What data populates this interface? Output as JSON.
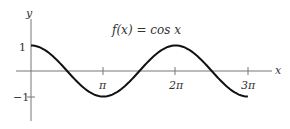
{
  "chart_data": {
    "type": "line",
    "title": "f(x) = cos x",
    "xlabel": "x",
    "ylabel": "y",
    "x_ticks": [
      {
        "value": 3.14159,
        "label": "π"
      },
      {
        "value": 6.28318,
        "label": "2π"
      },
      {
        "value": 9.42478,
        "label": "3π"
      }
    ],
    "y_ticks": [
      {
        "value": 1,
        "label": "1"
      },
      {
        "value": -1,
        "label": "−1"
      }
    ],
    "xlim": [
      0,
      9.42478
    ],
    "ylim": [
      -1,
      1
    ],
    "series": [
      {
        "name": "cos x",
        "function": "cos",
        "x_start": 0,
        "x_end": 9.42478,
        "points": [
          [
            0,
            1
          ],
          [
            1.5708,
            0
          ],
          [
            3.14159,
            -1
          ],
          [
            4.71239,
            0
          ],
          [
            6.28318,
            1
          ],
          [
            7.85398,
            0
          ],
          [
            9.42478,
            -1
          ]
        ]
      }
    ],
    "grid": false,
    "legend": "none"
  },
  "labels": {
    "function": "f(x) = cos x",
    "x_axis": "x",
    "y_axis": "y",
    "tick_pi": "π",
    "tick_2pi": "2π",
    "tick_3pi": "3π",
    "tick_one": "1",
    "tick_neg_one": "−1"
  }
}
